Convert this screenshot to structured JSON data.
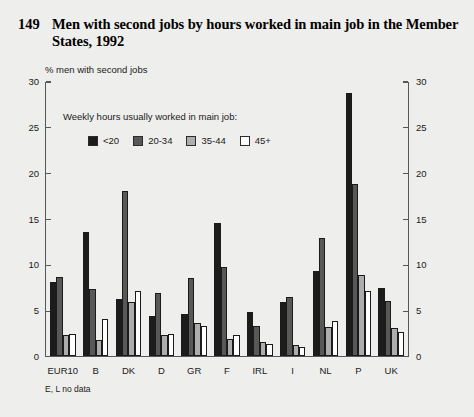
{
  "figure": {
    "number": "149",
    "title": "Men with second jobs by hours worked in main job in the Member States, 1992",
    "subtitle": "% men with second jobs",
    "footnote": "E, L no data"
  },
  "legend": {
    "title": "Weekly hours usually worked in main job:",
    "position": "inside-top-left"
  },
  "colors": {
    "series_lt20": "#1c1c1c",
    "series_20_34": "#585858",
    "series_35_44": "#adadad",
    "series_45plus": "#ffffff",
    "background": "#eeeeec",
    "axis": "#55585a",
    "text": "#1a1a1a"
  },
  "chart_data": {
    "type": "bar",
    "title": "Men with second jobs by hours worked in main job in the Member States, 1992",
    "subtitle": "% men with second jobs",
    "xlabel": "",
    "ylabel": "% men with second jobs",
    "ylim": [
      0,
      30
    ],
    "yticks": [
      0,
      5,
      10,
      15,
      20,
      25,
      30
    ],
    "ytick_labels": [
      "0",
      "5",
      "10",
      "15",
      "20",
      "25",
      "30"
    ],
    "grid": false,
    "dual_axis": true,
    "categories": [
      "EUR10",
      "B",
      "DK",
      "D",
      "GR",
      "F",
      "IRL",
      "I",
      "NL",
      "P",
      "UK"
    ],
    "series": [
      {
        "name": "<20",
        "color": "#1c1c1c",
        "values": [
          8.0,
          13.5,
          6.2,
          4.3,
          4.5,
          14.5,
          4.8,
          5.8,
          9.2,
          28.7,
          7.4
        ]
      },
      {
        "name": "20-34",
        "color": "#585858",
        "values": [
          8.6,
          7.3,
          18.0,
          6.8,
          8.5,
          9.7,
          3.2,
          6.4,
          12.8,
          18.7,
          6.0
        ]
      },
      {
        "name": "35-44",
        "color": "#adadad",
        "values": [
          2.3,
          1.7,
          5.9,
          2.2,
          3.6,
          1.8,
          1.5,
          1.2,
          3.1,
          8.8,
          3.0
        ]
      },
      {
        "name": "45+",
        "color": "#ffffff",
        "values": [
          2.4,
          4.0,
          7.0,
          2.4,
          3.2,
          2.2,
          1.3,
          0.9,
          3.8,
          7.0,
          2.6
        ]
      }
    ],
    "annotations": [
      "E, L no data"
    ]
  }
}
